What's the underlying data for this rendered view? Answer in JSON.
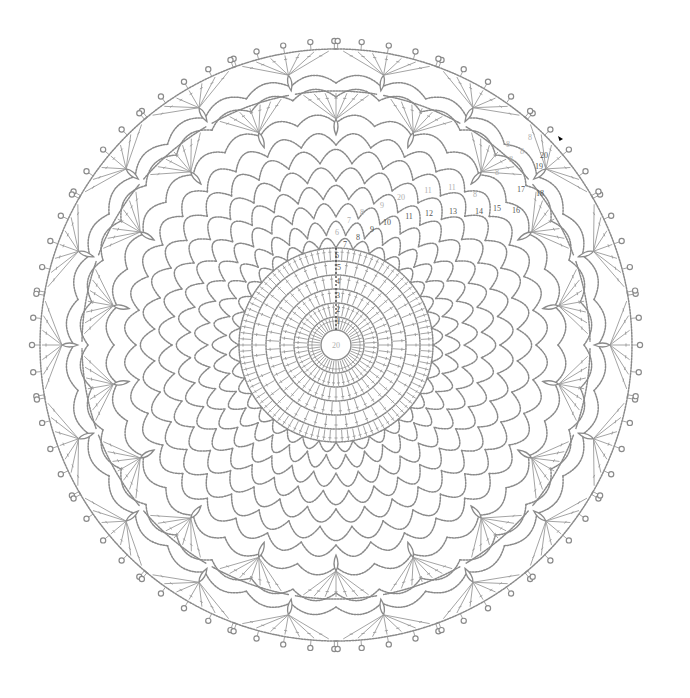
{
  "diagram": {
    "center": {
      "x": 336,
      "y": 345
    },
    "line_color": "#8c8c8c",
    "label_color": "#555555",
    "center_label": "20",
    "core_rings": [
      15,
      28,
      42,
      56,
      70,
      84
    ],
    "core_spokes": 48,
    "treble_ring": {
      "inner": 84,
      "outer": 97,
      "count": 96
    },
    "mesh_rounds": [
      {
        "r": 110,
        "count": 36
      },
      {
        "r": 128,
        "count": 36
      },
      {
        "r": 146,
        "count": 36
      },
      {
        "r": 164,
        "count": 36
      },
      {
        "r": 182,
        "count": 36
      },
      {
        "r": 200,
        "count": 36
      },
      {
        "r": 216,
        "count": 36
      }
    ],
    "fans": {
      "repeats": 18,
      "inner_radius": 232,
      "outer_radius": 282,
      "picot_radius": 304
    },
    "start_marker": {
      "x": 563,
      "y": 139,
      "symbol": "arrow-start"
    },
    "round_labels": [
      {
        "text": "1",
        "x": 338,
        "y": 322
      },
      {
        "text": "2",
        "x": 338,
        "y": 310
      },
      {
        "text": "3",
        "x": 338,
        "y": 296
      },
      {
        "text": "4",
        "x": 338,
        "y": 282
      },
      {
        "text": "5",
        "x": 339,
        "y": 268
      },
      {
        "text": "6",
        "x": 337,
        "y": 256
      },
      {
        "text": "7",
        "x": 345,
        "y": 245
      },
      {
        "text": "8",
        "x": 358,
        "y": 238
      },
      {
        "text": "9",
        "x": 372,
        "y": 230
      },
      {
        "text": "10",
        "x": 387,
        "y": 223
      },
      {
        "text": "11",
        "x": 409,
        "y": 217
      },
      {
        "text": "12",
        "x": 429,
        "y": 214
      },
      {
        "text": "13",
        "x": 453,
        "y": 212
      },
      {
        "text": "14",
        "x": 479,
        "y": 212
      },
      {
        "text": "15",
        "x": 497,
        "y": 209
      },
      {
        "text": "16",
        "x": 516,
        "y": 211
      },
      {
        "text": "17",
        "x": 521,
        "y": 190
      },
      {
        "text": "18",
        "x": 540,
        "y": 194
      },
      {
        "text": "19",
        "x": 539,
        "y": 167
      },
      {
        "text": "20",
        "x": 544,
        "y": 156
      }
    ],
    "light_labels": [
      {
        "text": "6",
        "x": 337,
        "y": 233
      },
      {
        "text": "7",
        "x": 349,
        "y": 221
      },
      {
        "text": "8",
        "x": 362,
        "y": 213
      },
      {
        "text": "9",
        "x": 382,
        "y": 206
      },
      {
        "text": "20",
        "x": 401,
        "y": 198
      },
      {
        "text": "11",
        "x": 428,
        "y": 191
      },
      {
        "text": "11",
        "x": 452,
        "y": 188
      },
      {
        "text": "8",
        "x": 475,
        "y": 195
      },
      {
        "text": "8",
        "x": 497,
        "y": 173
      },
      {
        "text": "8",
        "x": 511,
        "y": 160
      },
      {
        "text": "8",
        "x": 508,
        "y": 145
      },
      {
        "text": "8",
        "x": 522,
        "y": 152
      },
      {
        "text": "8",
        "x": 530,
        "y": 138
      }
    ]
  }
}
